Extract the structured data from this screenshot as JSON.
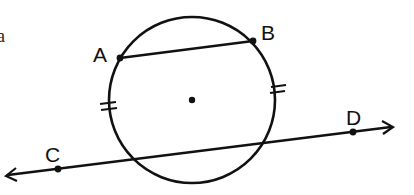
{
  "diagram": {
    "stroke_color": "#111111",
    "background": "#ffffff",
    "text_fragment": "a",
    "circle": {
      "cx": 192,
      "cy": 100,
      "r": 83,
      "center_point": true
    },
    "points": {
      "A": {
        "label": "A",
        "x": 120,
        "y": 58
      },
      "B": {
        "label": "B",
        "x": 253,
        "y": 41
      },
      "C": {
        "label": "C",
        "x": 58,
        "y": 169
      },
      "D": {
        "label": "D",
        "x": 353,
        "y": 132
      }
    },
    "chord": {
      "from": "A",
      "to": "B"
    },
    "line": {
      "through": [
        "C",
        "D"
      ],
      "arrows": "both"
    },
    "congruence_marks": [
      {
        "position": "left-arc",
        "ticks": 2
      },
      {
        "position": "right-arc",
        "ticks": 2
      }
    ]
  }
}
